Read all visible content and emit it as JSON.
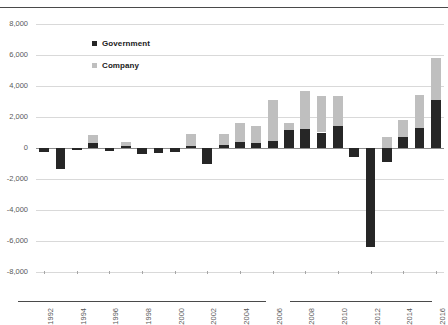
{
  "figure": {
    "title_fragment": "",
    "legend": [
      {
        "label": "Government",
        "color": "#262626",
        "key": "government"
      },
      {
        "label": "Company",
        "color": "#bfbfbf",
        "key": "company"
      }
    ]
  },
  "chart_data": {
    "type": "bar",
    "stacked": true,
    "title": "",
    "xlabel": "",
    "ylabel": "",
    "ylim": [
      -8000,
      8000
    ],
    "ytick_step": 2000,
    "ytick_labels": [
      "8,000",
      "6,000",
      "4,000",
      "2,000",
      "0",
      "-2,000",
      "-4,000",
      "-6,000",
      "-8,000"
    ],
    "ytick_values": [
      8000,
      6000,
      4000,
      2000,
      0,
      -2000,
      -4000,
      -6000,
      -8000
    ],
    "grid": true,
    "legend_position": "upper-left-inside",
    "categories": [
      "1992",
      "1993",
      "1994",
      "1995",
      "1996",
      "1997",
      "1998",
      "1999",
      "2000",
      "2001",
      "2002",
      "2003",
      "2004",
      "2005",
      "2006",
      "2007",
      "2008",
      "2009",
      "2010",
      "2011",
      "2012",
      "2013",
      "2014",
      "2015",
      "2016"
    ],
    "xtick_labels": [
      "1992",
      "1994",
      "1996",
      "1998",
      "2000",
      "2002",
      "2004",
      "2006",
      "2008",
      "2010",
      "2012",
      "2014",
      "2016"
    ],
    "xtick_indices": [
      0,
      2,
      4,
      6,
      8,
      10,
      12,
      14,
      16,
      18,
      20,
      22,
      24
    ],
    "series": [
      {
        "name": "Government",
        "color": "#262626",
        "values": [
          -250,
          -1350,
          -120,
          300,
          -180,
          150,
          -400,
          -350,
          -250,
          130,
          -1000,
          200,
          400,
          350,
          420,
          1150,
          1250,
          1000,
          1400,
          -600,
          -6400,
          -900,
          700,
          1300,
          3100
        ]
      },
      {
        "name": "Company",
        "color": "#bfbfbf",
        "values": [
          0,
          0,
          0,
          550,
          0,
          250,
          0,
          0,
          0,
          800,
          0,
          700,
          1200,
          1100,
          2700,
          450,
          2450,
          2350,
          1950,
          0,
          0,
          700,
          1100,
          2150,
          2700
        ]
      }
    ]
  }
}
